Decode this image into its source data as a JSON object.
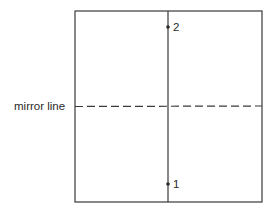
{
  "diagram": {
    "mirror_label": "mirror line",
    "points": [
      {
        "label": "1",
        "x": 168,
        "y": 184
      },
      {
        "label": "2",
        "x": 168,
        "y": 27
      }
    ],
    "box": {
      "x": 75,
      "y": 11,
      "width": 187,
      "height": 191
    },
    "vertical_line_x": 168,
    "mirror_line_y": 106,
    "stroke_color": "#3a3a3a"
  }
}
